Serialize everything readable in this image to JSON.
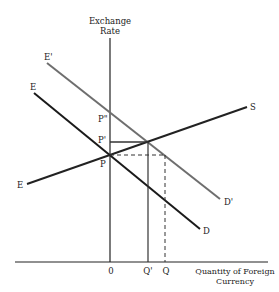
{
  "axes": {
    "y_label_line1": "Exchange",
    "y_label_line2": "Rate",
    "x_label_line1": "Quantity of Foreign",
    "x_label_line2": "Currency",
    "origin": "0"
  },
  "curves": {
    "supply": {
      "start_label": "E",
      "end_label": "S",
      "color": "#222222"
    },
    "demand": {
      "start_label": "E",
      "end_label": "D",
      "color": "#1a1a1a"
    },
    "demand_shifted": {
      "start_label": "E'",
      "end_label": "D'",
      "color": "#6e6e6e"
    }
  },
  "price_labels": {
    "p": "P",
    "p_prime": "P'",
    "p_double_prime": "P\""
  },
  "quantity_labels": {
    "q_prime": "Q'",
    "q": "Q"
  }
}
